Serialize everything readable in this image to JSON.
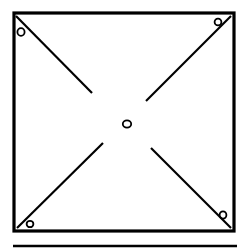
{
  "figure": {
    "type": "technical-line-drawing",
    "canvas": {
      "width": 248,
      "height": 252,
      "background": "#ffffff"
    },
    "stroke": {
      "color": "#000000",
      "outline_width": 3.2,
      "diagonal_width": 2.2,
      "hole_width": 1.8,
      "rule_width": 2.6
    },
    "panel": {
      "name": "square-panel-outline",
      "x": 14,
      "y": 13,
      "width": 220,
      "height": 218
    },
    "holes": [
      {
        "name": "hole-top-left",
        "cx": 21,
        "cy": 32,
        "rx": 3.6,
        "ry": 3.9
      },
      {
        "name": "hole-top-right",
        "cx": 218,
        "cy": 22,
        "rx": 3.4,
        "ry": 3.4
      },
      {
        "name": "hole-bottom-left",
        "cx": 30,
        "cy": 224,
        "rx": 3.4,
        "ry": 3.2
      },
      {
        "name": "hole-bottom-right",
        "cx": 223,
        "cy": 215,
        "rx": 3.4,
        "ry": 3.6
      },
      {
        "name": "hole-center",
        "cx": 127,
        "cy": 124,
        "rx": 4.2,
        "ry": 3.6
      }
    ],
    "diagonals": [
      {
        "name": "diagonal-top-left",
        "x1": 16,
        "y1": 16,
        "x2": 92,
        "y2": 93
      },
      {
        "name": "diagonal-top-right",
        "x1": 231,
        "y1": 16,
        "x2": 146,
        "y2": 101
      },
      {
        "name": "diagonal-bottom-left",
        "x1": 17,
        "y1": 228,
        "x2": 103,
        "y2": 143
      },
      {
        "name": "diagonal-bottom-right",
        "x1": 231,
        "y1": 228,
        "x2": 151,
        "y2": 148
      }
    ],
    "bottom_rule": {
      "name": "bottom-divider-rule",
      "x1": 13,
      "y1": 246,
      "x2": 237,
      "y2": 246
    }
  }
}
